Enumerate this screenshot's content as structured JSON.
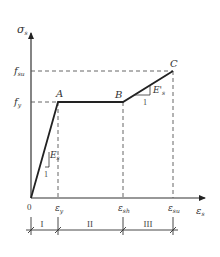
{
  "diagram": {
    "type": "stress-strain curve (steel)",
    "axes": {
      "y_label": "σ",
      "y_label_sub": "s",
      "x_label": "ε",
      "x_label_sub": "s",
      "origin_label": "0"
    },
    "y_levels": [
      {
        "name": "f_su",
        "main": "f",
        "sub": "su",
        "y": 71
      },
      {
        "name": "f_y",
        "main": "f",
        "sub": "y",
        "y": 102
      }
    ],
    "points": [
      {
        "label": "A",
        "x": 58,
        "y": 102
      },
      {
        "label": "B",
        "x": 123,
        "y": 102
      },
      {
        "label": "C",
        "x": 173,
        "y": 71
      }
    ],
    "x_ticks": [
      {
        "main": "ε",
        "sub": "y",
        "x": 58
      },
      {
        "main": "ε",
        "sub": "sh",
        "x": 123
      },
      {
        "main": "ε",
        "sub": "su",
        "x": 173
      }
    ],
    "slopes": [
      {
        "name": "elastic-modulus",
        "label": "E",
        "sub": "s",
        "run_label": "1"
      },
      {
        "name": "hardening-modulus",
        "label": "E'",
        "sub": "s",
        "run_label": "1"
      }
    ],
    "regions": [
      {
        "label": "I",
        "from_x": 31,
        "to_x": 58
      },
      {
        "label": "II",
        "from_x": 58,
        "to_x": 123
      },
      {
        "label": "III",
        "from_x": 123,
        "to_x": 173
      }
    ],
    "colors": {
      "curve": "#222222",
      "axis": "#333333",
      "dashed": "#555555",
      "text": "#333333"
    }
  }
}
